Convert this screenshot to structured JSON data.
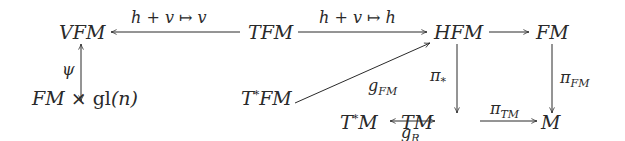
{
  "diagram": {
    "type": "commutative-diagram",
    "nodes": {
      "vfm": "VFM",
      "tfm": "TFM",
      "hfm": "HFM",
      "fm": "FM",
      "fm_gl": {
        "left": "FM",
        "times": "×",
        "gl": "gl",
        "arg": "(n)"
      },
      "tstar_fm": {
        "base": "T",
        "star": "*",
        "rest": "FM"
      },
      "tstar_m": {
        "base": "T",
        "star": "*",
        "rest": "M"
      },
      "tm": "TM",
      "m": "M"
    },
    "arrows": [
      {
        "id": "tfm-to-vfm",
        "from": "TFM",
        "to": "VFM",
        "label": "h + v ↦ v",
        "style": "single"
      },
      {
        "id": "tfm-to-hfm",
        "from": "TFM",
        "to": "HFM",
        "label": "h + v ↦ h",
        "style": "single"
      },
      {
        "id": "hfm-to-fm",
        "from": "HFM",
        "to": "FM",
        "label": "",
        "style": "single"
      },
      {
        "id": "vfm-psi",
        "from": "VFM",
        "to": "FM × gl(n)",
        "label": "ψ",
        "style": "double-headed"
      },
      {
        "id": "tstarfm-to-hfm",
        "from": "T*FM",
        "to": "HFM",
        "label": "g_FM",
        "style": "single"
      },
      {
        "id": "hfm-to-tm",
        "from": "HFM",
        "to": "TM",
        "label": "π_*",
        "style": "single"
      },
      {
        "id": "fm-to-m",
        "from": "FM",
        "to": "M",
        "label": "π_FM",
        "style": "single"
      },
      {
        "id": "tstarm-tm",
        "from": "T*M",
        "to": "TM",
        "label": "g_R",
        "style": "double-headed"
      },
      {
        "id": "tm-to-m",
        "from": "TM",
        "to": "M",
        "label": "π_TM",
        "style": "single"
      }
    ],
    "labels": {
      "top_left": "h + v ↦ v",
      "top_right": "h + v ↦ h",
      "psi": "ψ",
      "g": "g",
      "g_fm_sub": "FM",
      "pi": "π",
      "pi_star_sub": "*",
      "pi_fm_sub": "FM",
      "g_r_sub": "R",
      "pi_tm_sub": "TM"
    },
    "colors": {
      "ink": "#2a2a2a",
      "background": "#ffffff"
    }
  }
}
